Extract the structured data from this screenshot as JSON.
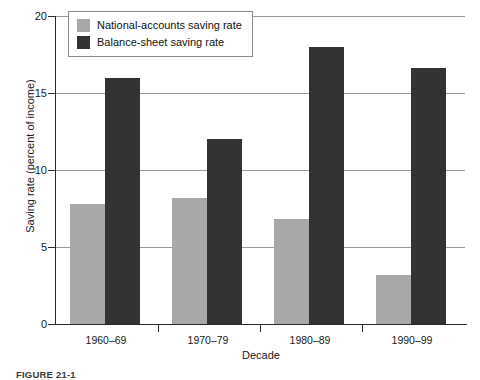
{
  "chart_data": {
    "type": "bar",
    "title": "",
    "xlabel": "Decade",
    "ylabel": "Saving rate (percent of income)",
    "categories": [
      "1960–69",
      "1970–79",
      "1980–89",
      "1990–99"
    ],
    "series": [
      {
        "name": "National-accounts saving rate",
        "color": "#a8a8a8",
        "values": [
          7.8,
          8.2,
          6.8,
          3.2
        ]
      },
      {
        "name": "Balance-sheet saving rate",
        "color": "#333333",
        "values": [
          16.0,
          12.0,
          18.0,
          16.6
        ]
      }
    ],
    "ylim": [
      0,
      20
    ],
    "yticks": [
      "0",
      "5",
      "10",
      "15",
      "20"
    ],
    "ytick_values": [
      0,
      5,
      10,
      15,
      20
    ],
    "grid": "horizontal",
    "legend_position": "top-left-inside"
  },
  "legend": {
    "entries": [
      {
        "label": "National-accounts saving rate",
        "color": "#a8a8a8"
      },
      {
        "label": "Balance-sheet saving rate",
        "color": "#333333"
      }
    ]
  },
  "caption": {
    "text": "FIGURE 21-1"
  }
}
